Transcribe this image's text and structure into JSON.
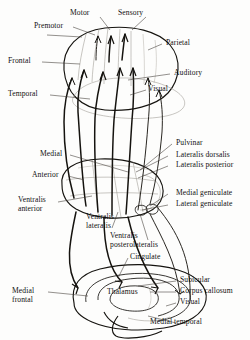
{
  "figure": {
    "ink_color": "#15130f",
    "background_color": "#fdfdfc",
    "faint_color": "#9a968f"
  },
  "cortex_labels": {
    "motor": "Motor",
    "sensory": "Sensory",
    "premotor": "Premotor",
    "frontal": "Frontal",
    "parietal": "Parietal",
    "auditory": "Auditory",
    "temporal": "Temporal",
    "visual": "Visual"
  },
  "thalamic_nuclei_left": {
    "medial": "Medial",
    "anterior": "Anterior",
    "ventralis_anterior_line1": "Ventralis",
    "ventralis_anterior_line2": "anterior",
    "ventralis_lateralis_line1": "Ventralis",
    "ventralis_lateralis_line2": "lateralis",
    "ventralis_posterolateralis_line1": "Ventralis",
    "ventralis_posterolateralis_line2": "posterolateralis"
  },
  "thalamic_nuclei_right": {
    "pulvinar": "Pulvinar",
    "lateralis_dorsalis": "Lateralis dorsalis",
    "lateralis_posterior": "Lateralis posterior",
    "medial_geniculate": "Medial geniculate",
    "lateral_geniculate": "Lateral geniculate"
  },
  "medial_view_labels": {
    "cingulate": "Cingulate",
    "thalamus": "Thalamus",
    "medial_frontal_line1": "Medial",
    "medial_frontal_line2": "frontal",
    "subicular": "Subicular",
    "corpus_callosum": "Corpus callosum",
    "visual": "Visual",
    "medial_temporal": "Medial temporal"
  }
}
